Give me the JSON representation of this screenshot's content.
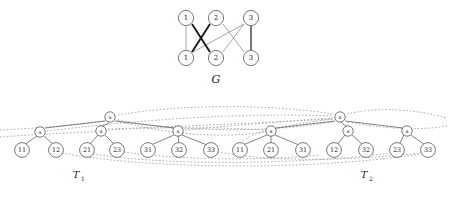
{
  "figure": {
    "caption_g": "G",
    "caption_t1": "T",
    "caption_t1_sub": "1",
    "caption_t2": "T",
    "caption_t2_sub": "2"
  },
  "graph_g": {
    "top_nodes": [
      {
        "label": "1",
        "x": 186,
        "y": 18
      },
      {
        "label": "2",
        "x": 216,
        "y": 18
      },
      {
        "label": "3",
        "x": 251,
        "y": 18
      }
    ],
    "bottom_nodes": [
      {
        "label": "1",
        "x": 186,
        "y": 58
      },
      {
        "label": "2",
        "x": 216,
        "y": 58
      },
      {
        "label": "3",
        "x": 251,
        "y": 58
      }
    ],
    "edges": [
      {
        "from": "top-1",
        "to": "bottom-1",
        "style": "light"
      },
      {
        "from": "top-1",
        "to": "bottom-2",
        "style": "bold"
      },
      {
        "from": "top-2",
        "to": "bottom-1",
        "style": "bold"
      },
      {
        "from": "top-2",
        "to": "bottom-3",
        "style": "light"
      },
      {
        "from": "top-3",
        "to": "bottom-1",
        "style": "light"
      },
      {
        "from": "top-3",
        "to": "bottom-2",
        "style": "light"
      },
      {
        "from": "top-3",
        "to": "bottom-3",
        "style": "mid"
      }
    ]
  },
  "tree_t1": {
    "root": {
      "label": "a",
      "x": 110,
      "y": 117
    },
    "internal": [
      {
        "label": "a",
        "x": 40,
        "y": 132
      },
      {
        "label": "a",
        "x": 101,
        "y": 131
      },
      {
        "label": "a",
        "x": 178,
        "y": 131
      }
    ],
    "leaves": [
      {
        "label": "11",
        "x": 22,
        "y": 150
      },
      {
        "label": "12",
        "x": 56,
        "y": 150
      },
      {
        "label": "21",
        "x": 87,
        "y": 150
      },
      {
        "label": "23",
        "x": 117,
        "y": 150
      },
      {
        "label": "31",
        "x": 148,
        "y": 150
      },
      {
        "label": "32",
        "x": 179,
        "y": 150
      },
      {
        "label": "33",
        "x": 211,
        "y": 150
      }
    ]
  },
  "tree_t2": {
    "root": {
      "label": "a",
      "x": 340,
      "y": 117
    },
    "internal": [
      {
        "label": "a",
        "x": 271,
        "y": 131
      },
      {
        "label": "a",
        "x": 348,
        "y": 131
      },
      {
        "label": "a",
        "x": 407,
        "y": 131
      }
    ],
    "leaves": [
      {
        "label": "11",
        "x": 240,
        "y": 150
      },
      {
        "label": "21",
        "x": 271,
        "y": 150
      },
      {
        "label": "31",
        "x": 303,
        "y": 150
      },
      {
        "label": "12",
        "x": 334,
        "y": 150
      },
      {
        "label": "32",
        "x": 366,
        "y": 150
      },
      {
        "label": "23",
        "x": 397,
        "y": 150
      },
      {
        "label": "33",
        "x": 428,
        "y": 150
      }
    ]
  },
  "colors": {
    "node_stroke": "#555555",
    "edge_bold": "#1a1a1a",
    "edge_light": "#9a9a9a",
    "tree_edge": "#6b6b6b",
    "dotted": "#8c8c8c",
    "background": "#ffffff"
  }
}
